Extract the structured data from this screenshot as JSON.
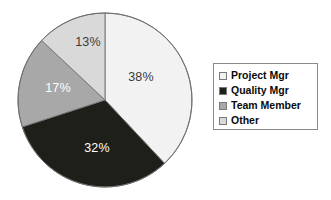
{
  "chart_data": {
    "type": "pie",
    "title": "",
    "categories": [
      "Project Mgr",
      "Quality Mgr",
      "Team Member",
      "Other"
    ],
    "values": [
      38,
      32,
      17,
      13
    ],
    "value_labels": [
      "38%",
      "32%",
      "17%",
      "13%"
    ],
    "units": "percent",
    "start_angle_deg": 0,
    "direction": "clockwise",
    "colors": [
      "#f2f2f2",
      "#1f1f1a",
      "#a8a8a8",
      "#d9d9d9"
    ],
    "label_colors": [
      "#3a3a3a",
      "#ffffff",
      "#ffffff",
      "#3a3a3a"
    ],
    "legend": {
      "position": "right",
      "bordered": true,
      "entries": [
        {
          "label": "Project Mgr",
          "color": "#f2f2f2",
          "value_label": "38%"
        },
        {
          "label": "Quality Mgr",
          "color": "#1f1f1a",
          "value_label": "32%"
        },
        {
          "label": "Team Member",
          "color": "#a8a8a8",
          "value_label": "17%"
        },
        {
          "label": "Other",
          "color": "#d9d9d9",
          "value_label": "13%"
        }
      ]
    },
    "grid": false,
    "xlabel": "",
    "ylabel": ""
  },
  "pie_geometry": {
    "center_x": 105,
    "center_y": 100,
    "radius": 87,
    "outline_color": "#6f6f6f"
  },
  "slice_label_positions": [
    {
      "text": "38%",
      "x": 141,
      "y": 78
    },
    {
      "text": "32%",
      "x": 97,
      "y": 149
    },
    {
      "text": "17%",
      "x": 58,
      "y": 89
    },
    {
      "text": "13%",
      "x": 88,
      "y": 43
    }
  ]
}
